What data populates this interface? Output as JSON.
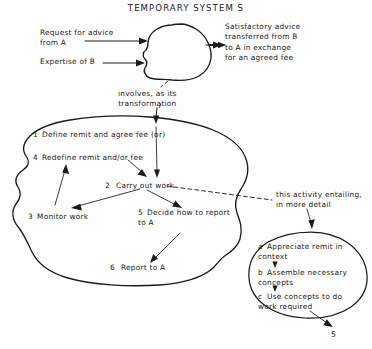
{
  "title": "TEMPORARY SYSTEM S",
  "inputs": [
    {
      "id": "request-for-advice",
      "label": "Request for advice\nfrom A"
    },
    {
      "id": "expertise-of-b",
      "label": "Expertise of B"
    }
  ],
  "output": {
    "id": "satisfactory-advice",
    "label": "Satisfactory advice\ntransferred from B\nto A in exchange\nfor an agreed fee"
  },
  "transformation_note": "involves, as its\ntransformation",
  "detail_note": "this activity entailing,\nin more detail",
  "main_activities": [
    {
      "number": "1",
      "label": "Define remit and agree fee (or)"
    },
    {
      "number": "4",
      "label": "Redefine remit and/or fee"
    },
    {
      "number": "2",
      "label": "Carry out work"
    },
    {
      "number": "3",
      "label": "Monitor work"
    },
    {
      "number": "5",
      "label": "Decide how to report\nto A"
    },
    {
      "number": "6",
      "label": "Report to A"
    }
  ],
  "sub_activities": [
    {
      "letter": "a",
      "label": "Appreciate remit in\ncontext"
    },
    {
      "letter": "b",
      "label": "Assemble necessary\nconcepts"
    },
    {
      "letter": "c",
      "label": "Use concepts to do\nwork required"
    }
  ],
  "footer_marker": "5",
  "colors": {
    "ink": "#1b1b1b",
    "background": "#fefefe"
  }
}
